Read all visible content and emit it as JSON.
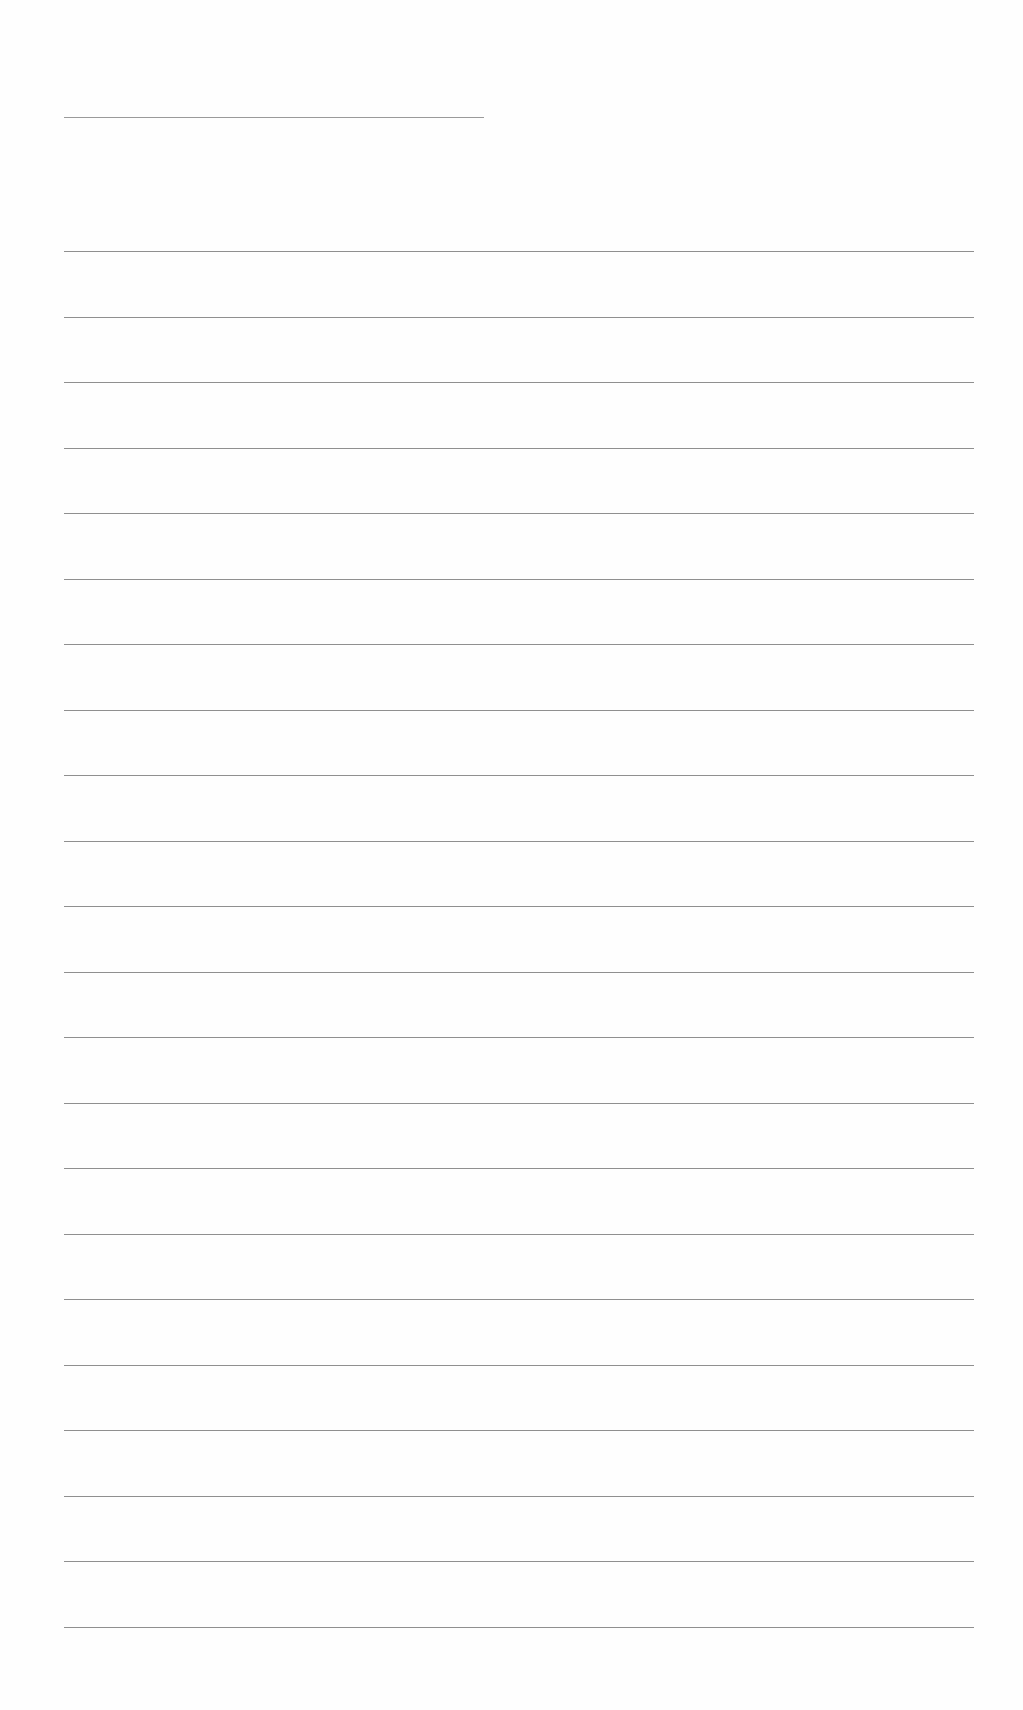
{
  "document": {
    "type": "blank lined sheet",
    "title_line": {
      "text": ""
    },
    "line_count": 22,
    "line_color": "#8f8f8f",
    "lines": [
      "",
      "",
      "",
      "",
      "",
      "",
      "",
      "",
      "",
      "",
      "",
      "",
      "",
      "",
      "",
      "",
      "",
      "",
      "",
      "",
      "",
      ""
    ]
  }
}
